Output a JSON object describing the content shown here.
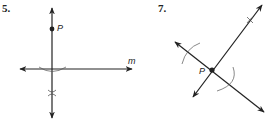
{
  "figures": [
    {
      "number": "5.",
      "point_label": "P",
      "line_label": "m",
      "description": "Perpendicular from point P to line m, with construction arcs and intersection mark"
    },
    {
      "number": "7.",
      "point_label": "P",
      "description": "Perpendicular through point P on a line, with construction arcs and intersection mark"
    }
  ],
  "colors": {
    "ink": "#222222",
    "background": "#ffffff"
  }
}
